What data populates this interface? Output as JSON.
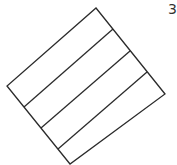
{
  "diagram": {
    "stroke_color": "#2b2b2b",
    "stroke_width": 1.3,
    "outline": {
      "points": "96,8 165,94 70,164 7,86"
    },
    "dividers": [
      {
        "x1": 24,
        "y1": 107,
        "x2": 113,
        "y2": 29
      },
      {
        "x1": 41,
        "y1": 128,
        "x2": 130,
        "y2": 51
      },
      {
        "x1": 58,
        "y1": 149,
        "x2": 147,
        "y2": 72
      }
    ],
    "strip_count": 4
  },
  "corner_label": {
    "text": "3",
    "note": "partially clipped at right edge"
  }
}
